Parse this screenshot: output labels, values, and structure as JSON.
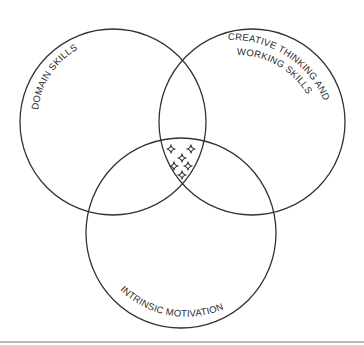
{
  "diagram": {
    "type": "venn",
    "circles": [
      {
        "id": "domain",
        "label": "DOMAIN SKILLS",
        "cx": 113,
        "cy": 122,
        "r": 93
      },
      {
        "id": "creative",
        "label_line1": "CREATIVE THINKING AND",
        "label_line2": "WORKING SKILLS",
        "cx": 252,
        "cy": 122,
        "r": 93
      },
      {
        "id": "motivation",
        "label": "INTRINSIC MOTIVATION",
        "cx": 181,
        "cy": 233,
        "r": 95
      }
    ],
    "intersection_marks": {
      "symbol": "four-point-star",
      "count": 6,
      "points": [
        [
          171,
          149
        ],
        [
          191,
          149
        ],
        [
          182,
          158
        ],
        [
          174,
          166
        ],
        [
          188,
          166
        ],
        [
          182,
          175
        ]
      ]
    },
    "colors": {
      "stroke": "#333333",
      "text": "#2a2a2a",
      "background": "#ffffff",
      "bottom_rule": "#b8b8b8"
    }
  }
}
